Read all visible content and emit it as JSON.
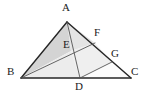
{
  "figure": {
    "type": "geometric-diagram",
    "canvas": {
      "width": 143,
      "height": 96
    },
    "colors": {
      "stroke": "#262626",
      "thin_stroke": "#4a4a4a",
      "shade_dark": "#d4d4d4",
      "shade_light": "#e9e9e9",
      "background": "#ffffff",
      "label": "#1b1b1b"
    },
    "points": {
      "A": {
        "label": "A",
        "x": 67,
        "y": 22,
        "label_x": 62,
        "label_y": 6
      },
      "B": {
        "label": "B",
        "x": 21,
        "y": 78,
        "label_x": 8,
        "label_y": 70
      },
      "C": {
        "label": "C",
        "x": 131,
        "y": 78,
        "label_x": 132,
        "label_y": 70
      },
      "D": {
        "label": "D",
        "x": 80,
        "y": 78,
        "label_x": 75,
        "label_y": 82
      },
      "E": {
        "label": "E",
        "x": 71,
        "y": 51,
        "label_x": 64,
        "label_y": 41
      },
      "F": {
        "label": "F",
        "x": 95,
        "y": 43,
        "label_x": 95,
        "label_y": 29
      },
      "G": {
        "label": "G",
        "x": 112,
        "y": 62,
        "label_x": 112,
        "label_y": 50
      }
    },
    "segments": [
      {
        "name": "side-AB",
        "from": "A",
        "to": "B",
        "weight": "thick"
      },
      {
        "name": "side-BC",
        "from": "B",
        "to": "C",
        "weight": "thick"
      },
      {
        "name": "side-AC",
        "from": "A",
        "to": "C",
        "weight": "thick"
      },
      {
        "name": "cevian-AD",
        "from": "A",
        "to": "D",
        "weight": "thin"
      },
      {
        "name": "cevian-BF",
        "from": "B",
        "to": "F",
        "weight": "thin"
      },
      {
        "name": "segment-DG",
        "from": "D",
        "to": "G",
        "weight": "thin"
      }
    ],
    "shaded_regions": [
      {
        "name": "region-ABE",
        "vertices": [
          "A",
          "B",
          "E"
        ],
        "fill": "shade_dark"
      },
      {
        "name": "region-BED",
        "vertices": [
          "B",
          "E",
          "D"
        ],
        "fill": "shade_light"
      },
      {
        "name": "region-AEF",
        "vertices": [
          "A",
          "E",
          "F"
        ],
        "fill": "shade_light"
      },
      {
        "name": "region-EFGD",
        "vertices": [
          "E",
          "F",
          "G",
          "D"
        ],
        "fill": "shade_light"
      }
    ]
  }
}
